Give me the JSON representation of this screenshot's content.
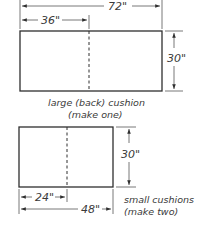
{
  "large_cushion": {
    "width_label": "72\"",
    "half_width_label": "36\"",
    "height_label": "30\"",
    "caption_line1": "large (back) cushion",
    "caption_line2": "(make one)"
  },
  "small_cushion": {
    "width_label": "48\"",
    "half_width_label": "24\"",
    "height_label": "30\"",
    "caption_line1": "small cushions",
    "caption_line2": "(make two)"
  },
  "colors": {
    "line": "#2e2e2e",
    "text": "#3a3a3a",
    "background": "#ffffff"
  }
}
